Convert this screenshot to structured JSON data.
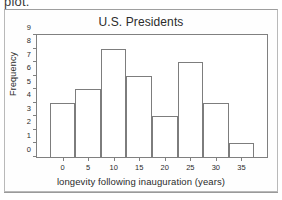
{
  "scan": {
    "top_text": "plot."
  },
  "chart_data": {
    "type": "bar",
    "title": "U.S. Presidents",
    "xlabel": "longevity following inauguration  (years)",
    "ylabel": "Frequency",
    "bin_width": 5,
    "bin_starts": [
      -2.5,
      2.5,
      7.5,
      12.5,
      17.5,
      22.5,
      27.5,
      32.5
    ],
    "categories": [
      "-2.5 to 2.5",
      "2.5 to 7.5",
      "7.5 to 12.5",
      "12.5 to 17.5",
      "17.5 to 22.5",
      "22.5 to 27.5",
      "27.5 to 32.5",
      "32.5 to 37.5"
    ],
    "values": [
      4,
      5,
      8,
      6,
      3,
      7,
      4,
      1
    ],
    "xlim": [
      -5,
      40
    ],
    "ylim": [
      0,
      9
    ],
    "xticks": [
      0,
      5,
      10,
      15,
      20,
      25,
      30,
      35
    ],
    "xtick_labels": [
      "0",
      "5",
      "10",
      "15",
      "20",
      "25",
      "30",
      "35"
    ],
    "yticks": [
      0,
      1,
      2,
      3,
      4,
      5,
      6,
      7,
      8,
      9
    ],
    "ytick_labels": [
      "0",
      "1",
      "2",
      "3",
      "4",
      "5",
      "6",
      "7",
      "8",
      "9"
    ],
    "grid": false,
    "legend": null,
    "bar_fill": "#ffffff",
    "bar_edge": "#7d7d7d",
    "axis_color": "#808080",
    "text_color": "#2b2b2b"
  }
}
